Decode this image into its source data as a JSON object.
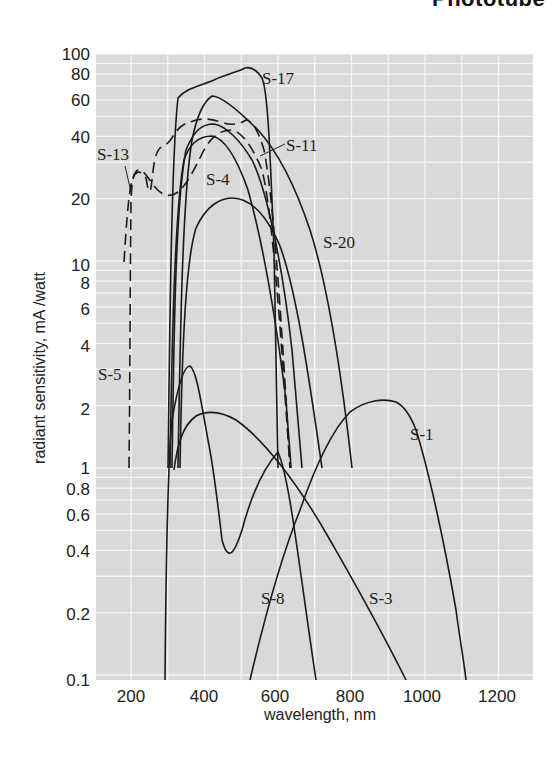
{
  "header": {
    "title": "Phototube"
  },
  "chart_data": {
    "type": "line",
    "title": "",
    "xlabel": "wavelength, nm",
    "ylabel": "radiant sensitivity, mA /watt",
    "xscale": "linear",
    "yscale": "log",
    "xlim": [
      100,
      1300
    ],
    "ylim": [
      0.1,
      100
    ],
    "x_ticks": [
      "200",
      "400",
      "600",
      "800",
      "1000",
      "1200"
    ],
    "y_ticks": [
      "100",
      "80",
      "60",
      "40",
      "20",
      "10",
      "8",
      "6",
      "4",
      "2",
      "1",
      "0.8",
      "0.6",
      "0.4",
      "0.2",
      "0.1"
    ],
    "grid": true,
    "background": "#d9d9d9",
    "series": [
      {
        "name": "S-1",
        "style": "solid",
        "x": [
          420,
          500,
          600,
          700,
          800,
          850,
          900,
          950,
          1000,
          1050,
          1100
        ],
        "y": [
          0.1,
          0.3,
          0.9,
          1.7,
          2.2,
          2.1,
          1.8,
          1.1,
          0.5,
          0.22,
          0.1
        ]
      },
      {
        "name": "S-3",
        "style": "solid",
        "x": [
          350,
          380,
          420,
          500,
          600,
          700,
          800,
          900,
          950
        ],
        "y": [
          1.0,
          1.5,
          1.75,
          1.6,
          1.0,
          0.55,
          0.28,
          0.13,
          0.1
        ]
      },
      {
        "name": "S-4",
        "style": "solid",
        "x": [
          300,
          320,
          350,
          400,
          450,
          500,
          550,
          600,
          640
        ],
        "y": [
          1.0,
          10,
          28,
          40,
          38,
          25,
          10,
          3,
          1.0
        ]
      },
      {
        "name": "S-5",
        "style": "dashed",
        "x": [
          190,
          195,
          200,
          220,
          260,
          300,
          350,
          400,
          450,
          500,
          550,
          600,
          640
        ],
        "y": [
          1.0,
          10,
          24,
          26,
          24,
          26,
          36,
          42,
          40,
          28,
          12,
          3,
          1.0
        ]
      },
      {
        "name": "S-8",
        "style": "solid",
        "x": [
          300,
          320,
          340,
          360,
          380,
          400,
          450,
          500,
          600,
          700
        ],
        "y": [
          0.1,
          0.5,
          1.5,
          2.8,
          3.0,
          2.0,
          0.4,
          1.4,
          0.45,
          0.1
        ]
      },
      {
        "name": "S-11",
        "style": "solid",
        "x": [
          310,
          330,
          350,
          400,
          440,
          500,
          550,
          600,
          650,
          690
        ],
        "y": [
          1.0,
          12,
          25,
          45,
          48,
          40,
          25,
          10,
          3,
          1.0
        ]
      },
      {
        "name": "S-13",
        "style": "dashed",
        "x": [
          180,
          190,
          200,
          230,
          260,
          300,
          350,
          400,
          450,
          500,
          550,
          600,
          640
        ],
        "y": [
          10,
          24,
          30,
          38,
          40,
          42,
          46,
          48,
          46,
          38,
          20,
          6,
          1.0
        ]
      },
      {
        "name": "S-17",
        "style": "solid",
        "x": [
          300,
          320,
          350,
          400,
          450,
          480,
          510,
          540,
          580,
          600,
          630
        ],
        "y": [
          1.0,
          20,
          60,
          70,
          78,
          85,
          82,
          70,
          30,
          8,
          1.0
        ]
      },
      {
        "name": "S-20",
        "style": "solid",
        "x": [
          330,
          360,
          400,
          430,
          480,
          550,
          600,
          650,
          700,
          760,
          800
        ],
        "y": [
          1.0,
          15,
          45,
          60,
          62,
          48,
          35,
          20,
          10,
          3,
          1.0
        ]
      },
      {
        "name": "unlabeled (20 mA/W peak)",
        "style": "solid",
        "x": [
          330,
          360,
          400,
          460,
          520,
          580,
          620,
          660,
          720
        ],
        "y": [
          1.0,
          8,
          16,
          20,
          18,
          12,
          6,
          3,
          1.0
        ]
      }
    ],
    "annotations": [
      "S-1",
      "S-3",
      "S-4",
      "S-5",
      "S-8",
      "S-11",
      "S-13",
      "S-17",
      "S-20"
    ]
  },
  "axis": {
    "x_ticks": [
      {
        "label": "200",
        "x": 131
      },
      {
        "label": "400",
        "x": 204
      },
      {
        "label": "600",
        "x": 275
      },
      {
        "label": "800",
        "x": 350
      },
      {
        "label": "1000",
        "x": 422
      },
      {
        "label": "1200",
        "x": 497
      }
    ],
    "y_ticks": [
      {
        "label": "100",
        "y": 54
      },
      {
        "label": "80",
        "y": 74
      },
      {
        "label": "60",
        "y": 100
      },
      {
        "label": "40",
        "y": 137
      },
      {
        "label": "20",
        "y": 199
      },
      {
        "label": "10",
        "y": 265
      },
      {
        "label": "8",
        "y": 283
      },
      {
        "label": "6",
        "y": 309
      },
      {
        "label": "4",
        "y": 346
      },
      {
        "label": "2",
        "y": 409
      },
      {
        "label": "1",
        "y": 468
      },
      {
        "label": "0.8",
        "y": 489
      },
      {
        "label": "0.6",
        "y": 515
      },
      {
        "label": "0.4",
        "y": 551
      },
      {
        "label": "0.2",
        "y": 614
      },
      {
        "label": "0.1",
        "y": 680
      }
    ],
    "xlabel": "wavelength, nm",
    "ylabel": "radiant sensitivity, mA /watt"
  },
  "labels": {
    "s1": "S-1",
    "s3": "S-3",
    "s4": "S-4",
    "s5": "S-5",
    "s8": "S-8",
    "s11": "S-11",
    "s13": "S-13",
    "s17": "S-17",
    "s20": "S-20"
  }
}
